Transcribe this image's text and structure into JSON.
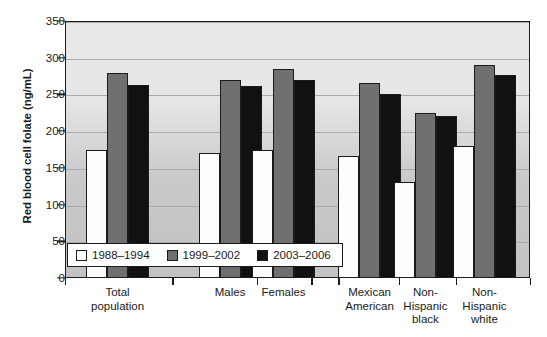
{
  "chart_data": {
    "type": "bar",
    "title": "",
    "subtitle": "",
    "xlabel": "",
    "ylabel": "Red blood cell folate (ng/mL)",
    "ylim": [
      0,
      350
    ],
    "yticks": [
      0,
      50,
      100,
      150,
      200,
      250,
      300,
      350
    ],
    "ytick_labels": [
      "0",
      "50",
      "100",
      "150",
      "200",
      "250",
      "300",
      "350"
    ],
    "grid": true,
    "grid_axis": "y",
    "legend_position": "inside-bottom-left",
    "categories": [
      "Total population",
      "Males",
      "Females",
      "Mexican American",
      "Non-Hispanic black",
      "Non-Hispanic white"
    ],
    "category_label_lines": [
      [
        "Total",
        "population"
      ],
      [
        "Males"
      ],
      [
        "Females"
      ],
      [
        "Mexican",
        "American"
      ],
      [
        "Non-",
        "Hispanic",
        "black"
      ],
      [
        "Non-",
        "Hispanic",
        "white"
      ]
    ],
    "series": [
      {
        "name": "1988–1994",
        "color": "#ffffff",
        "values": [
          175,
          170,
          175,
          166,
          131,
          180
        ]
      },
      {
        "name": "1999–2002",
        "color": "#707070",
        "values": [
          279,
          270,
          285,
          265,
          225,
          290
        ]
      },
      {
        "name": "2003–2006",
        "color": "#111111",
        "values": [
          263,
          261,
          270,
          251,
          221,
          276
        ]
      }
    ],
    "annotations": []
  },
  "legend": {
    "items": [
      {
        "label": "1988–1994",
        "swatch": "white-square-swatch"
      },
      {
        "label": "1999–2002",
        "swatch": "gray-square-swatch"
      },
      {
        "label": "2003–2006",
        "swatch": "black-square-swatch"
      }
    ]
  },
  "colors": {
    "series_1988_1994": "#ffffff",
    "series_1999_2002": "#707070",
    "series_2003_2006": "#111111",
    "plot_background_top": "#e8e8e8",
    "plot_background_bottom": "#c2c2c2",
    "gridline": "#a9a9a9",
    "axis": "#1b1b1b",
    "text": "#1a1a1a"
  }
}
